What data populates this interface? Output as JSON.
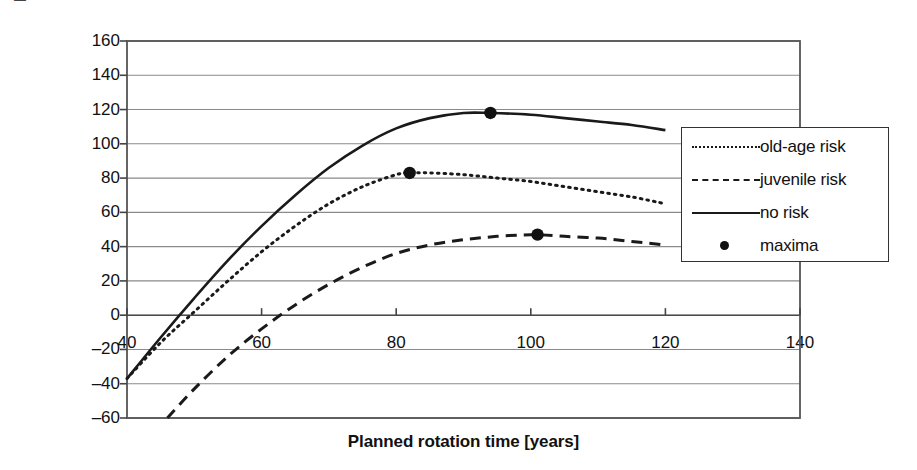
{
  "chart_data": {
    "type": "line",
    "title": "",
    "xlabel": "Planned rotation time [years]",
    "ylabel": "Expected land rent [EUR/ha/a]",
    "xlim": [
      40,
      140
    ],
    "ylim": [
      -60,
      160
    ],
    "xticks": [
      40,
      60,
      80,
      100,
      120,
      140
    ],
    "yticks": [
      -60,
      -40,
      -20,
      0,
      20,
      40,
      60,
      80,
      100,
      120,
      140,
      160
    ],
    "grid": "horizontal",
    "legend_position": "right-inside",
    "series": [
      {
        "name": "old-age risk",
        "style": "dotted",
        "color": "#1a1a1a",
        "x": [
          40,
          45,
          50,
          55,
          60,
          65,
          70,
          75,
          80,
          82,
          85,
          90,
          95,
          100,
          105,
          110,
          115,
          120
        ],
        "y": [
          -37,
          -16,
          2,
          20,
          37,
          52,
          65,
          75,
          82,
          83,
          83,
          82,
          80,
          78,
          75,
          72,
          69,
          65
        ]
      },
      {
        "name": "juvenile risk",
        "style": "dashed",
        "color": "#1a1a1a",
        "x": [
          46,
          50,
          55,
          60,
          65,
          70,
          75,
          80,
          85,
          90,
          95,
          100,
          101,
          105,
          110,
          115,
          120
        ],
        "y": [
          -60,
          -43,
          -24,
          -8,
          6,
          18,
          28,
          36,
          41,
          44,
          46,
          47,
          47,
          46,
          45,
          43,
          41
        ]
      },
      {
        "name": "no risk",
        "style": "solid",
        "color": "#1a1a1a",
        "x": [
          40,
          45,
          50,
          55,
          60,
          65,
          70,
          75,
          80,
          85,
          90,
          94,
          100,
          105,
          110,
          115,
          120
        ],
        "y": [
          -37,
          -13,
          10,
          32,
          52,
          70,
          86,
          99,
          109,
          115,
          118,
          118,
          117,
          115,
          113,
          111,
          108
        ]
      },
      {
        "name": "maxima",
        "style": "marker",
        "color": "#111111",
        "points": [
          {
            "x": 82,
            "y": 83,
            "series": "old-age risk"
          },
          {
            "x": 101,
            "y": 47,
            "series": "juvenile risk"
          },
          {
            "x": 94,
            "y": 118,
            "series": "no risk"
          }
        ]
      }
    ],
    "legend": [
      {
        "label": "old-age risk",
        "style": "dotted"
      },
      {
        "label": "juvenile risk",
        "style": "dashed"
      },
      {
        "label": "no risk",
        "style": "solid"
      },
      {
        "label": "maxima",
        "style": "marker"
      }
    ]
  }
}
